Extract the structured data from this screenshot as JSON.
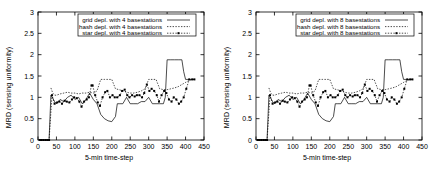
{
  "figure": {
    "background": "#ffffff",
    "panel_count": 2
  },
  "panels": [
    {
      "id": "left",
      "axis": {
        "ylabel": "MRD (sensing uniformity)",
        "xlabel": "5-min time-step",
        "yticks": [
          "0",
          "0.5",
          "1",
          "1.5",
          "2",
          "2.5",
          "3"
        ],
        "xticks": [
          "0",
          "50",
          "100",
          "150",
          "200",
          "250",
          "300",
          "350",
          "400",
          "450"
        ]
      },
      "legend": [
        {
          "label": "grid depl. with 4 basestations",
          "key": "solid-line"
        },
        {
          "label": "hash depl. with 4 basestations",
          "key": "dotted-line"
        },
        {
          "label": "star depl. with 4 basestations",
          "key": "dotted-line-with-points"
        }
      ]
    },
    {
      "id": "right",
      "axis": {
        "ylabel": "MRD (sensing uniformity)",
        "xlabel": "5-min time-step",
        "yticks": [
          "0",
          "0.5",
          "1",
          "1.5",
          "2",
          "2.5",
          "3"
        ],
        "xticks": [
          "0",
          "50",
          "100",
          "150",
          "200",
          "250",
          "300",
          "350",
          "400",
          "450"
        ]
      },
      "legend": [
        {
          "label": "grid depl. with 8 basestations",
          "key": "solid-line"
        },
        {
          "label": "hash depl. with 8 basestations",
          "key": "dotted-line"
        },
        {
          "label": "star depl. with 8 basestations",
          "key": "dotted-line-with-points"
        }
      ]
    }
  ],
  "chart_data": [
    {
      "type": "line",
      "title": "",
      "xlabel": "5-min time-step",
      "ylabel": "MRD (sensing uniformity)",
      "xlim": [
        0,
        450
      ],
      "ylim": [
        0,
        3
      ],
      "xticks": [
        0,
        50,
        100,
        150,
        200,
        250,
        300,
        350,
        400,
        450
      ],
      "yticks": [
        0,
        0.5,
        1,
        1.5,
        2,
        2.5,
        3
      ],
      "grid": false,
      "legend_position": "top-center",
      "color": "#000000",
      "series": [
        {
          "name": "grid depl. with 4 basestations",
          "style": "solid",
          "marker": "none",
          "x": [
            5,
            10,
            15,
            20,
            25,
            30,
            35,
            40,
            45,
            50,
            60,
            70,
            80,
            90,
            100,
            110,
            120,
            130,
            140,
            150,
            160,
            170,
            180,
            190,
            200,
            210,
            215,
            220,
            230,
            240,
            250,
            260,
            270,
            280,
            290,
            300,
            310,
            320,
            330,
            340,
            345,
            350,
            360,
            370,
            380,
            390,
            395,
            400,
            410,
            420,
            425
          ],
          "y": [
            0,
            0,
            0,
            0,
            0,
            0,
            1.05,
            0.98,
            0.9,
            0.85,
            0.95,
            0.9,
            1.0,
            1.05,
            0.95,
            1.0,
            0.85,
            0.95,
            1.1,
            0.95,
            0.85,
            0.6,
            0.5,
            0.45,
            0.43,
            0.55,
            0.85,
            0.85,
            0.85,
            1.0,
            0.85,
            0.85,
            0.85,
            0.9,
            0.9,
            1.0,
            0.85,
            0.85,
            0.85,
            0.85,
            1.0,
            1.88,
            1.88,
            1.88,
            1.88,
            1.88,
            1.6,
            1.42,
            1.42,
            1.42,
            1.42
          ]
        },
        {
          "name": "hash depl. with 4 basestations",
          "style": "dotted",
          "marker": "none",
          "x": [
            35,
            40,
            45,
            50,
            60,
            70,
            80,
            90,
            100,
            110,
            120,
            130,
            140,
            150,
            160,
            170,
            175,
            180,
            190,
            200,
            210,
            220,
            230,
            240,
            250,
            260,
            270,
            280,
            290,
            300,
            305,
            310,
            320,
            330,
            340,
            350,
            360,
            370,
            380,
            390,
            400,
            410,
            420,
            425
          ],
          "y": [
            1.22,
            1.1,
            1.05,
            1.05,
            1.08,
            1.1,
            1.12,
            1.1,
            1.1,
            1.08,
            1.1,
            1.1,
            1.12,
            1.1,
            1.15,
            1.42,
            1.42,
            1.42,
            1.42,
            1.42,
            1.2,
            1.18,
            1.15,
            1.12,
            1.1,
            1.1,
            1.12,
            1.15,
            1.2,
            1.42,
            1.42,
            1.42,
            1.42,
            1.2,
            1.18,
            1.18,
            1.2,
            1.22,
            1.25,
            1.3,
            1.35,
            1.4,
            1.42,
            1.42
          ]
        },
        {
          "name": "star depl. with 4 basestations",
          "style": "dotted",
          "marker": "square",
          "x": [
            5,
            10,
            15,
            20,
            25,
            30,
            38,
            45,
            52,
            58,
            65,
            72,
            78,
            85,
            92,
            98,
            105,
            112,
            118,
            125,
            132,
            138,
            145,
            148,
            155,
            162,
            168,
            175,
            182,
            188,
            195,
            202,
            208,
            215,
            222,
            228,
            235,
            242,
            248,
            255,
            262,
            268,
            275,
            282,
            288,
            295,
            302,
            308,
            315,
            322,
            328,
            335,
            342,
            348,
            355,
            362,
            368,
            375,
            382,
            388,
            395,
            402,
            410,
            418,
            424
          ],
          "y": [
            0,
            0,
            0,
            0,
            0,
            0,
            1.05,
            0.85,
            0.88,
            0.9,
            0.85,
            0.92,
            0.9,
            0.88,
            0.95,
            1.0,
            0.98,
            0.9,
            0.78,
            0.9,
            0.95,
            1.0,
            1.28,
            1.28,
            1.05,
            0.88,
            0.8,
            1.0,
            1.12,
            1.15,
            1.0,
            1.05,
            1.0,
            1.0,
            1.05,
            1.15,
            1.18,
            1.05,
            1.0,
            1.05,
            1.02,
            1.05,
            1.05,
            1.0,
            1.1,
            1.3,
            1.15,
            1.2,
            1.15,
            1.05,
            0.9,
            1.05,
            1.15,
            1.1,
            0.95,
            0.9,
            1.0,
            0.95,
            0.85,
            0.9,
            1.0,
            1.2,
            1.42,
            1.42,
            1.42
          ]
        }
      ]
    },
    {
      "type": "line",
      "title": "",
      "xlabel": "5-min time-step",
      "ylabel": "MRD (sensing uniformity)",
      "xlim": [
        0,
        450
      ],
      "ylim": [
        0,
        3
      ],
      "xticks": [
        0,
        50,
        100,
        150,
        200,
        250,
        300,
        350,
        400,
        450
      ],
      "yticks": [
        0,
        0.5,
        1,
        1.5,
        2,
        2.5,
        3
      ],
      "grid": false,
      "legend_position": "top-center",
      "color": "#000000",
      "series": [
        {
          "name": "grid depl. with 8 basestations",
          "style": "solid",
          "marker": "none",
          "x": [
            5,
            10,
            15,
            20,
            25,
            30,
            35,
            40,
            45,
            50,
            60,
            70,
            80,
            90,
            100,
            110,
            120,
            130,
            140,
            150,
            160,
            170,
            180,
            190,
            200,
            210,
            215,
            220,
            230,
            240,
            250,
            260,
            270,
            280,
            290,
            300,
            310,
            320,
            330,
            340,
            345,
            350,
            360,
            370,
            380,
            390,
            395,
            400,
            410,
            420,
            425
          ],
          "y": [
            0,
            0,
            0,
            0,
            0,
            0,
            1.05,
            0.98,
            0.9,
            0.85,
            0.95,
            0.9,
            1.0,
            1.05,
            0.95,
            1.0,
            0.85,
            0.95,
            1.1,
            0.95,
            0.85,
            0.6,
            0.5,
            0.45,
            0.43,
            0.55,
            0.85,
            0.85,
            0.85,
            1.0,
            0.85,
            0.85,
            0.85,
            0.9,
            0.9,
            1.0,
            0.85,
            0.85,
            0.85,
            0.85,
            1.0,
            1.88,
            1.88,
            1.88,
            1.88,
            1.88,
            1.6,
            1.42,
            1.42,
            1.42,
            1.42
          ]
        },
        {
          "name": "hash depl. with 8 basestations",
          "style": "dotted",
          "marker": "none",
          "x": [
            35,
            40,
            45,
            50,
            60,
            70,
            80,
            90,
            100,
            110,
            120,
            130,
            140,
            150,
            160,
            170,
            175,
            180,
            190,
            200,
            210,
            220,
            230,
            240,
            250,
            260,
            270,
            280,
            290,
            300,
            305,
            310,
            320,
            330,
            340,
            350,
            360,
            370,
            380,
            390,
            400,
            410,
            420,
            425
          ],
          "y": [
            1.22,
            1.1,
            1.05,
            1.05,
            1.08,
            1.1,
            1.12,
            1.1,
            1.1,
            1.08,
            1.1,
            1.1,
            1.12,
            1.1,
            1.15,
            1.42,
            1.42,
            1.42,
            1.42,
            1.42,
            1.2,
            1.18,
            1.15,
            1.12,
            1.1,
            1.1,
            1.12,
            1.15,
            1.2,
            1.42,
            1.42,
            1.42,
            1.42,
            1.2,
            1.18,
            1.18,
            1.2,
            1.22,
            1.25,
            1.3,
            1.35,
            1.4,
            1.42,
            1.42
          ]
        },
        {
          "name": "star depl. with 8 basestations",
          "style": "dotted",
          "marker": "square",
          "x": [
            5,
            10,
            15,
            20,
            25,
            30,
            38,
            45,
            52,
            58,
            65,
            72,
            78,
            85,
            92,
            98,
            105,
            112,
            118,
            125,
            132,
            138,
            145,
            148,
            155,
            162,
            168,
            175,
            182,
            188,
            195,
            202,
            208,
            215,
            222,
            228,
            235,
            242,
            248,
            255,
            262,
            268,
            275,
            282,
            288,
            295,
            302,
            308,
            315,
            322,
            328,
            335,
            342,
            348,
            355,
            362,
            368,
            375,
            382,
            388,
            395,
            402,
            410,
            418,
            424
          ],
          "y": [
            0,
            0,
            0,
            0,
            0,
            0,
            1.05,
            0.85,
            0.88,
            0.9,
            0.85,
            0.92,
            0.9,
            0.88,
            0.95,
            1.0,
            0.98,
            0.9,
            0.78,
            0.9,
            0.95,
            1.0,
            1.28,
            1.28,
            1.05,
            0.88,
            0.8,
            1.0,
            1.12,
            1.15,
            1.0,
            1.05,
            1.0,
            1.0,
            1.05,
            1.15,
            1.18,
            1.05,
            1.0,
            1.05,
            1.02,
            1.05,
            1.05,
            1.0,
            1.1,
            1.3,
            1.15,
            1.2,
            1.15,
            1.05,
            0.9,
            1.05,
            1.15,
            1.1,
            0.95,
            0.9,
            1.0,
            0.95,
            0.85,
            0.9,
            1.0,
            1.2,
            1.42,
            1.42,
            1.42
          ]
        }
      ]
    }
  ]
}
